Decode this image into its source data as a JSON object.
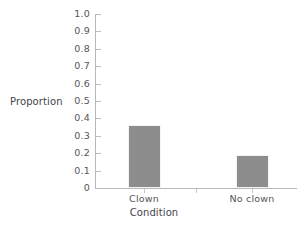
{
  "chart_data": {
    "type": "bar",
    "title": "",
    "categories": [
      "Clown",
      "No clown"
    ],
    "values": [
      0.36,
      0.19
    ],
    "xlabel": "Condition",
    "ylabel": "Proportion",
    "ylim": [
      0,
      1.0
    ],
    "ytick_labels": [
      "1.0",
      "0.9",
      "0.8",
      "0.7",
      "0.6",
      "0.5",
      "0.4",
      "0.3",
      "0.2",
      "0.1",
      "0"
    ],
    "ytick_values": [
      1.0,
      0.9,
      0.8,
      0.7,
      0.6,
      0.5,
      0.4,
      0.3,
      0.2,
      0.1,
      0
    ],
    "grid": false,
    "legend": null,
    "legend_position": "none",
    "bar_color": "#8d8d8d",
    "axis_color": "#b8b8b8",
    "background_color": "#ffffff"
  }
}
